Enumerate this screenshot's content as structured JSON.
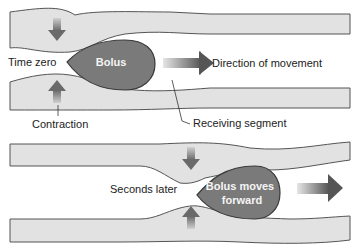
{
  "diagram": {
    "colors": {
      "wall_fill": "#e2e2e2",
      "wall_stroke": "#555555",
      "bolus_fill": "#7a7a7a",
      "bolus_stroke": "#3a3a3a",
      "arrow_dark": "#5a5a5a",
      "arrow_light": "#d8d8d8",
      "text": "#222222",
      "bolus_text": "#f4f4f4"
    },
    "top_panel": {
      "time_label": "Time zero",
      "bolus_label": "Bolus",
      "direction_label": "Direction of movement",
      "contraction_label": "Contraction",
      "receiving_label": "Receiving segment"
    },
    "bottom_panel": {
      "time_label": "Seconds later",
      "bolus_label_line1": "Bolus moves",
      "bolus_label_line2": "forward"
    }
  }
}
